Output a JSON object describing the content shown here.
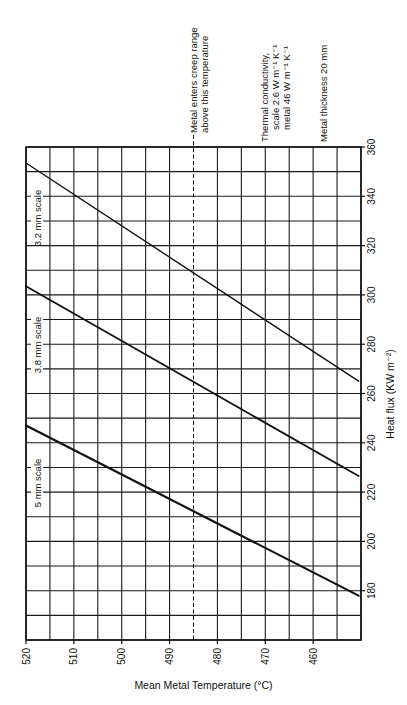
{
  "chart_data": {
    "type": "line",
    "orientation": "rotated-90",
    "title": "",
    "xlabel": "Mean Metal Temperature (°C)",
    "ylabel": "Heat flux (KW m⁻²)",
    "x_axis": {
      "reversed": true,
      "range": [
        520,
        450
      ],
      "ticks": [
        520,
        510,
        500,
        490,
        480,
        470,
        460
      ],
      "grid_step": 5
    },
    "y_axis": {
      "range": [
        160,
        360
      ],
      "ticks": [
        180,
        200,
        220,
        240,
        260,
        280,
        300,
        320,
        340,
        360
      ],
      "grid_step": 10
    },
    "grid": true,
    "series": [
      {
        "name": "5 mm scale",
        "label": "5 mm scale",
        "points": [
          [
            520,
            247
          ],
          [
            450.5,
            178
          ]
        ],
        "stroke_width": 2.2
      },
      {
        "name": "3.8 mm scale",
        "label": "3.8 mm scale",
        "points": [
          [
            520,
            303.5
          ],
          [
            450.5,
            226.5
          ]
        ],
        "stroke_width": 1.8
      },
      {
        "name": "3.2 mm scale",
        "label": "3.2 mm scale",
        "points": [
          [
            520,
            353.5
          ],
          [
            450.5,
            265
          ]
        ],
        "stroke_width": 1.4
      }
    ],
    "reference_line": {
      "x": 485,
      "style": "dashed",
      "label_lines": [
        "Metal enters creep range",
        "above this temperature"
      ]
    },
    "annotations": [
      {
        "id": "conductivity",
        "lines": [
          "Thermal conductivity,",
          "scale 2.6 W m⁻¹ K⁻¹",
          "metal 46 W m⁻¹ K⁻¹"
        ]
      },
      {
        "id": "thickness",
        "lines": [
          "Metal thickness 20 mm"
        ]
      }
    ]
  },
  "colors": {
    "ink": "#111111",
    "grid": "#1a1a1a",
    "background": "#ffffff"
  }
}
